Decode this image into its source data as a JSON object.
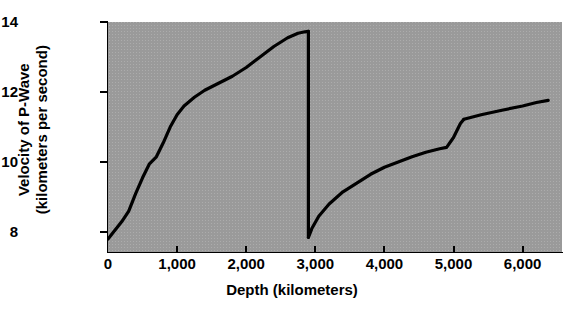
{
  "chart_data": {
    "type": "line",
    "title": "",
    "xlabel": "Depth (kilometers)",
    "ylabel": "Velocity of P-Wave (kilometers per second)",
    "ylabel_line1": "Velocity of P-Wave",
    "ylabel_line2": "(kilometers per second)",
    "xlim": [
      0,
      6570
    ],
    "ylim": [
      7.43,
      14.0
    ],
    "xticks": [
      0,
      1000,
      2000,
      3000,
      4000,
      5000,
      6000
    ],
    "xtick_labels": [
      "0",
      "1,000",
      "2,000",
      "3,000",
      "4,000",
      "5,000",
      "6,000"
    ],
    "yticks": [
      8,
      10,
      12,
      14
    ],
    "ytick_labels": [
      "8",
      "10",
      "12",
      "14"
    ],
    "grid": false,
    "legend": false,
    "plot_background_color": "#9a9a9a",
    "line_color": "#000000",
    "line_width_px": 3.2,
    "series": [
      {
        "name": "P-wave velocity (mantle)",
        "x": [
          0,
          60,
          120,
          200,
          300,
          400,
          500,
          600,
          700,
          800,
          900,
          1000,
          1100,
          1250,
          1400,
          1600,
          1800,
          2000,
          2200,
          2400,
          2600,
          2750,
          2850,
          2900
        ],
        "y": [
          7.8,
          7.95,
          8.1,
          8.3,
          8.6,
          9.1,
          9.55,
          9.95,
          10.15,
          10.55,
          11.0,
          11.35,
          11.6,
          11.85,
          12.05,
          12.25,
          12.45,
          12.7,
          13.0,
          13.3,
          13.55,
          13.68,
          13.72,
          13.73
        ]
      },
      {
        "name": "Core-mantle boundary discontinuity",
        "x": [
          2900,
          2900
        ],
        "y": [
          13.73,
          7.85
        ]
      },
      {
        "name": "P-wave velocity (outer core)",
        "x": [
          2900,
          2950,
          3050,
          3200,
          3400,
          3600,
          3800,
          4000,
          4200,
          4400,
          4600,
          4800,
          4900,
          5000,
          5100,
          5150
        ],
        "y": [
          7.85,
          8.1,
          8.45,
          8.8,
          9.15,
          9.4,
          9.65,
          9.85,
          10.0,
          10.15,
          10.28,
          10.38,
          10.42,
          10.7,
          11.1,
          11.22
        ]
      },
      {
        "name": "P-wave velocity (inner core)",
        "x": [
          5150,
          5400,
          5700,
          6000,
          6200,
          6370
        ],
        "y": [
          11.22,
          11.35,
          11.48,
          11.6,
          11.7,
          11.76
        ]
      }
    ],
    "annotations": [
      {
        "label": "core-mantle boundary",
        "depth_km": 2900,
        "velocity_above": 13.73,
        "velocity_below": 7.85
      },
      {
        "label": "inner core boundary",
        "depth_km": 5150,
        "velocity_below": 10.42,
        "velocity_above": 11.22
      }
    ]
  }
}
